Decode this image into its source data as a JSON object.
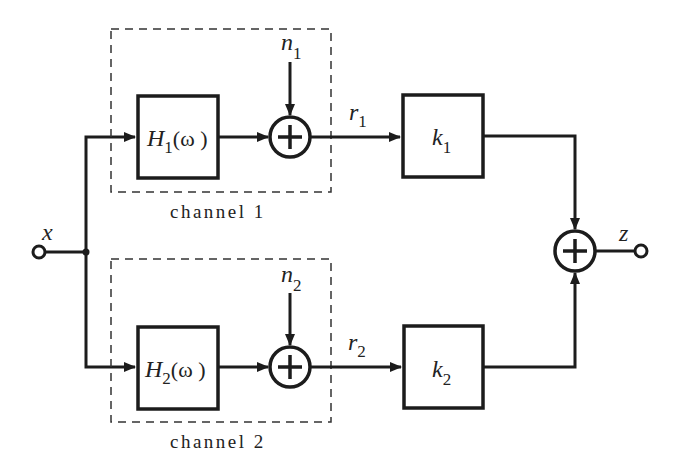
{
  "diagram": {
    "input": {
      "label": "x"
    },
    "output": {
      "label": "z"
    },
    "channels": [
      {
        "name": "channel 1",
        "filter": {
          "symbol": "H",
          "sub": "1",
          "arg": "(ω )"
        },
        "noise": {
          "symbol": "n",
          "sub": "1"
        },
        "signal": {
          "symbol": "r",
          "sub": "1"
        },
        "gain": {
          "symbol": "k",
          "sub": "1"
        },
        "sum_symbol": "+"
      },
      {
        "name": "channel 2",
        "filter": {
          "symbol": "H",
          "sub": "2",
          "arg": "(ω )"
        },
        "noise": {
          "symbol": "n",
          "sub": "2"
        },
        "signal": {
          "symbol": "r",
          "sub": "2"
        },
        "gain": {
          "symbol": "k",
          "sub": "2"
        },
        "sum_symbol": "+"
      }
    ],
    "output_sum_symbol": "+",
    "colors": {
      "line": "#1c1c1c",
      "background": "#ffffff"
    }
  }
}
